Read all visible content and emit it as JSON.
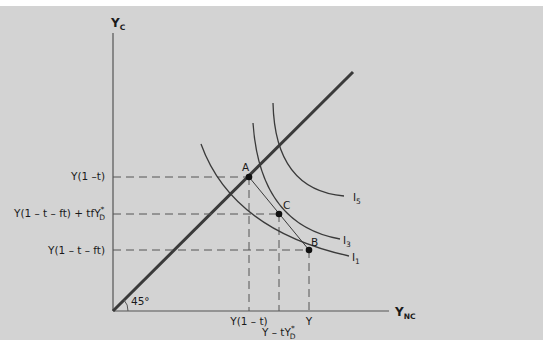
{
  "diagram": {
    "y_axis_label": "Y",
    "y_axis_sub": "C",
    "x_axis_label": "Y",
    "x_axis_sub": "NC",
    "angle_label": "45°",
    "y_ticks": [
      {
        "label": "Y(1 –t)"
      },
      {
        "label_pre": "Y(1 – t – ft) + tfY",
        "sup": "*",
        "sub": "D"
      },
      {
        "label": "Y(1 – t – ft)"
      }
    ],
    "x_ticks": [
      {
        "label": "Y(1 – t)"
      },
      {
        "label_pre": "Y – tY",
        "sup": "*",
        "sub": "D"
      },
      {
        "label": "Y"
      }
    ],
    "points": [
      {
        "label": "A"
      },
      {
        "label": "C"
      },
      {
        "label": "B"
      }
    ],
    "curves": [
      {
        "label": "I",
        "sub": "5"
      },
      {
        "label": "I",
        "sub": "3"
      },
      {
        "label": "I",
        "sub": "1"
      }
    ],
    "colors": {
      "background": "#d3d3d3",
      "line": "#3a3a3a",
      "dashed": "#555555"
    }
  }
}
